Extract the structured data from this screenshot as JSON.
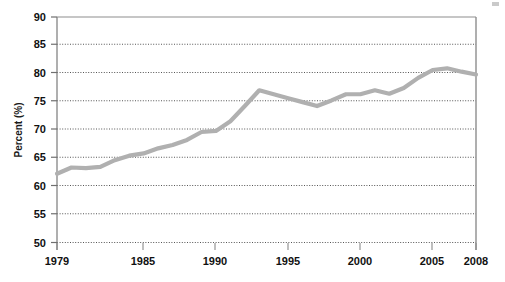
{
  "chart_data": {
    "type": "line",
    "title": "",
    "subtitle": "",
    "xlabel": "",
    "ylabel": "Percent (%)",
    "ylim": [
      50,
      90
    ],
    "xlim": [
      1979,
      2008
    ],
    "ytick_labels": [
      "90",
      "85",
      "80",
      "75",
      "70",
      "65",
      "60",
      "55",
      "50"
    ],
    "ytick_values": [
      90,
      85,
      80,
      75,
      70,
      65,
      60,
      55,
      50
    ],
    "xtick_labels": [
      "1979",
      "1985",
      "1990",
      "1995",
      "2000",
      "2005",
      "2008"
    ],
    "xtick_values": [
      1979,
      1985,
      1990,
      1995,
      2000,
      2005,
      2008
    ],
    "grid": "horizontal-dotted",
    "legend": "none",
    "series": [
      {
        "name": "Percent",
        "color": "#b0b0b0",
        "x": [
          1979,
          1980,
          1981,
          1982,
          1983,
          1984,
          1985,
          1986,
          1987,
          1988,
          1989,
          1990,
          1991,
          1992,
          1993,
          1994,
          1995,
          1996,
          1997,
          1998,
          1999,
          2000,
          2001,
          2002,
          2003,
          2004,
          2005,
          2006,
          2007,
          2008
        ],
        "values": [
          62.2,
          63.3,
          63.2,
          63.4,
          64.6,
          65.4,
          65.8,
          66.7,
          67.3,
          68.2,
          69.6,
          69.8,
          71.5,
          74.2,
          77.0,
          76.3,
          75.6,
          74.9,
          74.2,
          75.2,
          76.3,
          76.3,
          77.0,
          76.4,
          77.4,
          79.2,
          80.6,
          80.9,
          80.3,
          79.8
        ]
      }
    ]
  },
  "axes": {
    "y_axis_title": "Percent (%)"
  },
  "colors": {
    "line": "#b0b0b0",
    "grid": "#5a5a5a",
    "axis": "#7a7a7a",
    "text": "#111111",
    "background": "#ffffff"
  }
}
